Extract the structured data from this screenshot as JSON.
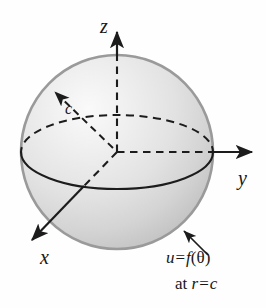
{
  "figure": {
    "type": "diagram",
    "width": 266,
    "height": 308,
    "background_color": "#fefefe"
  },
  "axes": {
    "z": {
      "label": "z",
      "direction": "up",
      "arrow": true
    },
    "y": {
      "label": "y",
      "direction": "right",
      "arrow": true
    },
    "x": {
      "label": "x",
      "direction": "down-left",
      "arrow": true
    }
  },
  "radius": {
    "label": "c",
    "description": "radius-arrow-from-center-to-surface",
    "arrow": true,
    "line_style": "dashed"
  },
  "conditions": {
    "line1": {
      "lhs": "u",
      "equals": "=",
      "rhs_function": "f",
      "rhs_open": "(",
      "rhs_arg": "θ",
      "rhs_close": ")"
    },
    "line2": {
      "prefix": "at",
      "lhs": "r",
      "equals": "=",
      "rhs": "c"
    }
  },
  "sphere": {
    "center_x": 117,
    "center_y": 152,
    "radius_x": 96,
    "radius_y": 97,
    "fill_light": "#f4f4f4",
    "fill_mid": "#d6d6d6",
    "fill_dark": "#bcbcbc",
    "outline_color": "#9a9a9a",
    "equator_color": "#1c1c1c"
  },
  "colors": {
    "stroke": "#1c1c1c",
    "sphere_outline": "#9a9a9a",
    "text": "#171717"
  }
}
